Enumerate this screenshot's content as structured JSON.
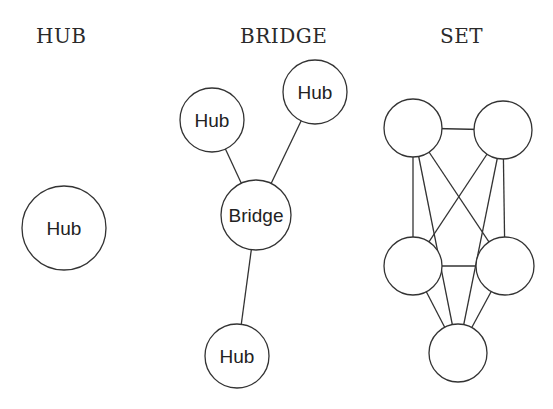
{
  "diagrams": [
    {
      "id": "hub",
      "title": "HUB",
      "nodes": [
        {
          "id": "h1",
          "label": "Hub"
        }
      ],
      "edges": []
    },
    {
      "id": "bridge",
      "title": "BRIDGE",
      "nodes": [
        {
          "id": "b_hub1",
          "label": "Hub"
        },
        {
          "id": "b_hub2",
          "label": "Hub"
        },
        {
          "id": "b_bridge",
          "label": "Bridge"
        },
        {
          "id": "b_hub3",
          "label": "Hub"
        }
      ],
      "edges": [
        [
          "b_hub1",
          "b_bridge"
        ],
        [
          "b_hub2",
          "b_bridge"
        ],
        [
          "b_bridge",
          "b_hub3"
        ]
      ]
    },
    {
      "id": "set",
      "title": "SET",
      "nodes": [
        {
          "id": "s_tl",
          "label": ""
        },
        {
          "id": "s_tr",
          "label": ""
        },
        {
          "id": "s_ml",
          "label": ""
        },
        {
          "id": "s_mr",
          "label": ""
        },
        {
          "id": "s_b",
          "label": ""
        }
      ],
      "edges": [
        [
          "s_tl",
          "s_tr"
        ],
        [
          "s_tl",
          "s_ml"
        ],
        [
          "s_tl",
          "s_b"
        ],
        [
          "s_tl",
          "s_mr"
        ],
        [
          "s_tr",
          "s_ml"
        ],
        [
          "s_tr",
          "s_b"
        ],
        [
          "s_tr",
          "s_mr"
        ],
        [
          "s_ml",
          "s_mr"
        ],
        [
          "s_ml",
          "s_b"
        ],
        [
          "s_mr",
          "s_b"
        ]
      ]
    }
  ]
}
